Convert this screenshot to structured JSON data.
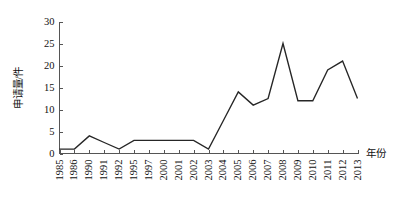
{
  "chart_data": {
    "type": "line",
    "title": "",
    "xlabel": "年份",
    "ylabel": "申请量/件",
    "categories": [
      "1985",
      "1986",
      "1990",
      "1991",
      "1992",
      "1995",
      "1997",
      "2000",
      "2001",
      "2002",
      "2003",
      "2004",
      "2005",
      "2006",
      "2007",
      "2008",
      "2009",
      "2010",
      "2011",
      "2012",
      "2013"
    ],
    "values": [
      1,
      1,
      4,
      2.5,
      1,
      3,
      3,
      3,
      3,
      3,
      1,
      7.5,
      14,
      11,
      12.5,
      25,
      12,
      12,
      19,
      21,
      12.5
    ],
    "series": [
      {
        "name": "申请量",
        "values": [
          1,
          1,
          4,
          2.5,
          1,
          3,
          3,
          3,
          3,
          3,
          1,
          7.5,
          14,
          11,
          12.5,
          25,
          12,
          12,
          19,
          21,
          12.5
        ]
      }
    ],
    "yticks": [
      0,
      5,
      10,
      15,
      20,
      25,
      30
    ],
    "ytick_labels": [
      "0",
      "5",
      "10",
      "15",
      "20",
      "25",
      "30"
    ],
    "ylim": [
      0,
      30
    ],
    "xlim": [
      0,
      20
    ],
    "grid": false,
    "legend": false,
    "legend_position": "none",
    "line_color": "#262626",
    "axis_color": "#555555",
    "background_color": "#ffffff"
  },
  "axes": {
    "y_axis_title": "申请量/件",
    "x_axis_title": "年份"
  }
}
